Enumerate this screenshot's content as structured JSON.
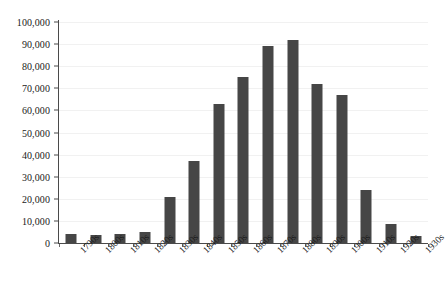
{
  "chart_data": {
    "type": "bar",
    "title": "",
    "xlabel": "",
    "ylabel": "",
    "categories": [
      "1790s",
      "1800s",
      "1810s",
      "1820s",
      "1830s",
      "1840s",
      "1850s",
      "1860s",
      "1870s",
      "1880s",
      "1890s",
      "1900s",
      "1910s",
      "1920s",
      "1930s"
    ],
    "values": [
      4000,
      3800,
      4200,
      5000,
      21000,
      37000,
      63000,
      75000,
      89000,
      92000,
      72000,
      67000,
      24000,
      8500,
      3000
    ],
    "ylim": [
      0,
      100000
    ],
    "y_ticks": [
      0,
      10000,
      20000,
      30000,
      40000,
      50000,
      60000,
      70000,
      80000,
      90000,
      100000
    ],
    "y_tick_labels": [
      "0",
      "10,000",
      "20,000",
      "30,000",
      "40,000",
      "50,000",
      "60,000",
      "70,000",
      "80,000",
      "90,000",
      "100,000"
    ],
    "grid": true,
    "legend": false,
    "bar_color": "#464646",
    "gridline_color": "#f1f1f1",
    "axis_color": "#4a4a4a",
    "text_color": "#1a1a1a",
    "x_tick_label_rotation": -45
  }
}
